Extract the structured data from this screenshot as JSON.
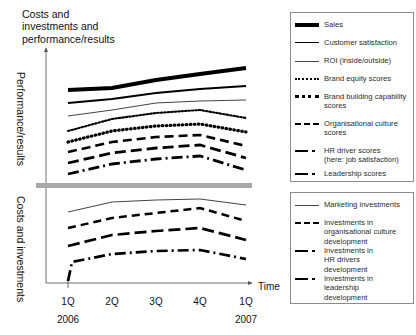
{
  "title": "Costs and\ninvestments and\nperformance/results",
  "axes": {
    "y_upper_label": "Performance/results",
    "y_lower_label": "Costs and investments",
    "x_label": "Time",
    "x_ticks": [
      "1Q",
      "2Q",
      "3Q",
      "4Q",
      "1Q"
    ],
    "years": [
      "2006",
      "2007"
    ]
  },
  "legend_top": [
    {
      "label": "Sales",
      "style": "thick-solid"
    },
    {
      "label": "Customer satisfaction",
      "style": "medium-solid"
    },
    {
      "label": "ROI (inside/outside)",
      "style": "thin-solid"
    },
    {
      "label": "Brand equity scores",
      "style": "fine-dotted"
    },
    {
      "label": "Brand building capability\nscores",
      "style": "bold-dotted"
    },
    {
      "label": "Organisational culture\nscores",
      "style": "dashed"
    },
    {
      "label": "HR driver scores\n(here: job satisfaction)",
      "style": "dash-dot"
    },
    {
      "label": "Leadership scores",
      "style": "dash-dot-tight"
    }
  ],
  "legend_bottom": [
    {
      "label": "Marketing investments",
      "style": "thin-solid"
    },
    {
      "label": "Investments in\norganisational culture\ndevelopment",
      "style": "dashed"
    },
    {
      "label": "Investments in\nHR drivers\ndevelopment",
      "style": "dash-dot"
    },
    {
      "label": "Investments in\nleadership\ndevelopment",
      "style": "dash-dot-tight"
    }
  ],
  "chart_data": {
    "type": "line",
    "title": "Costs and investments and performance/results",
    "xlabel": "Time",
    "ylabel": "Costs and investments and performance/results",
    "categories": [
      "1Q 2006",
      "2Q 2006",
      "3Q 2006",
      "4Q 2006",
      "1Q 2007"
    ],
    "grid": false,
    "legend_position": "right",
    "panels": [
      {
        "name": "Performance/results",
        "ylabel": "Performance/results",
        "ylim": [
          0,
          100
        ],
        "series": [
          {
            "name": "Sales",
            "style": "thick-solid",
            "values": [
              78,
              82,
              87,
              91,
              94
            ]
          },
          {
            "name": "Customer satisfaction",
            "style": "medium-solid",
            "values": [
              68,
              73,
              78,
              81,
              83
            ]
          },
          {
            "name": "ROI (inside/outside)",
            "style": "thin-solid",
            "values": [
              58,
              66,
              71,
              72,
              73
            ]
          },
          {
            "name": "Brand equity scores",
            "style": "fine-dotted",
            "values": [
              45,
              55,
              60,
              63,
              57
            ]
          },
          {
            "name": "Brand building capability scores",
            "style": "bold-dotted",
            "values": [
              37,
              46,
              51,
              53,
              46
            ]
          },
          {
            "name": "Organisational culture scores",
            "style": "dashed",
            "values": [
              29,
              38,
              43,
              45,
              36
            ]
          },
          {
            "name": "HR driver scores (here: job satisfaction)",
            "style": "dash-dot",
            "values": [
              20,
              30,
              35,
              38,
              27
            ]
          },
          {
            "name": "Leadership scores",
            "style": "dash-dot-tight",
            "values": [
              12,
              22,
              27,
              30,
              19
            ]
          }
        ]
      },
      {
        "name": "Costs and investments",
        "ylabel": "Costs and investments",
        "ylim": [
          0,
          100
        ],
        "series": [
          {
            "name": "Marketing investments",
            "style": "thin-solid",
            "values": [
              62,
              76,
              80,
              82,
              74
            ]
          },
          {
            "name": "Investments in organisational culture development",
            "style": "dashed",
            "values": [
              44,
              59,
              64,
              70,
              55
            ]
          },
          {
            "name": "Investments in HR drivers development",
            "style": "dash-dot",
            "values": [
              26,
              44,
              50,
              54,
              40
            ]
          },
          {
            "name": "Investments in leadership development",
            "style": "dash-dot-tight",
            "values": [
              5,
              27,
              32,
              33,
              24
            ]
          }
        ]
      }
    ]
  }
}
